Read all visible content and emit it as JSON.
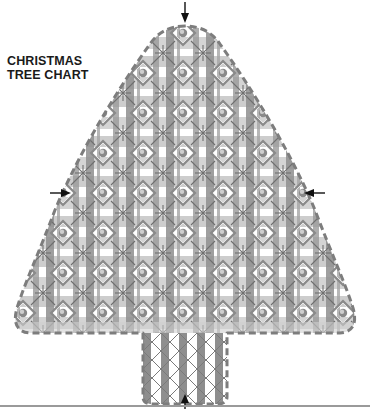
{
  "title": {
    "line1": "CHRISTMAS",
    "line2": "TREE CHART"
  },
  "diagram": {
    "shape": "christmas-tree",
    "pattern": "plaid grid with star crosses and diamond-framed beads",
    "markers": [
      {
        "name": "top-center-arrow",
        "direction": "down"
      },
      {
        "name": "left-center-arrow",
        "direction": "right"
      },
      {
        "name": "right-center-arrow",
        "direction": "left"
      },
      {
        "name": "bottom-center-arrow",
        "direction": "up"
      }
    ],
    "colors": {
      "dark_band": "#8c8c8c",
      "light_band": "#c8c8c8",
      "outline": "#7a7a7a",
      "arrow": "#111111",
      "background": "#ffffff"
    }
  }
}
